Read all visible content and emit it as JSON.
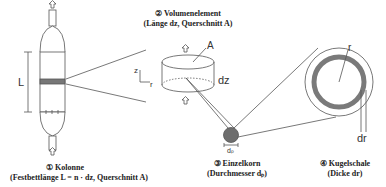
{
  "column": {
    "title": "① Kolonne",
    "subtitle": "(Festbettlänge L = n · dz, Querschnitt A)",
    "length_label": "L"
  },
  "volume_element": {
    "title": "② Volumenelement",
    "subtitle": "(Länge dz, Querschnitt A)",
    "area_label": "A",
    "height_label": "dz",
    "axis_z": "z",
    "axis_r": "r"
  },
  "particle": {
    "title": "③ Einzelkorn",
    "subtitle": "(Durchmesser dₚ)",
    "diameter_label": "dₚ"
  },
  "shell": {
    "title": "④ Kugelschale",
    "subtitle": "(Dicke dr)",
    "radius_label": "r",
    "thickness_label": "dr"
  },
  "colors": {
    "line": "#555555",
    "particle_fill": "#6e6e6e",
    "shell_fill": "#7a7a7a",
    "band_fill": "#777777"
  }
}
